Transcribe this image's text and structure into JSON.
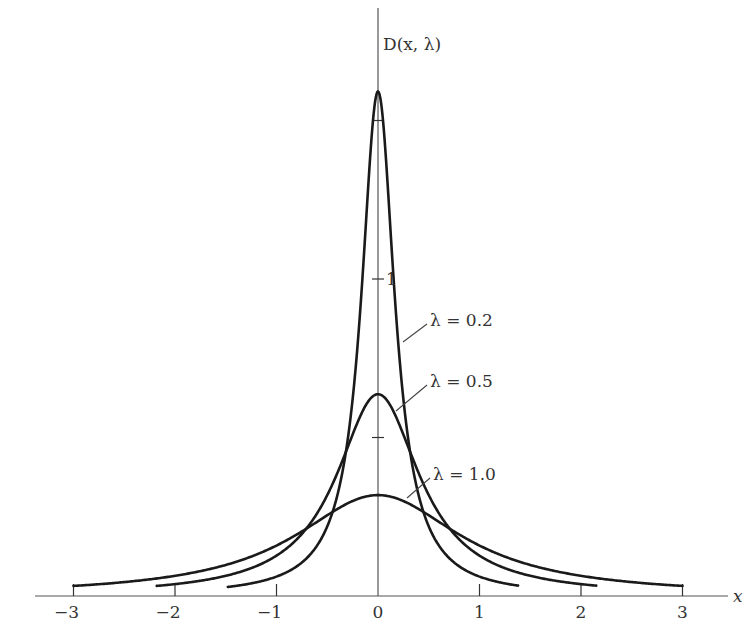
{
  "chart_data": {
    "type": "line",
    "title": "",
    "xlabel": "x",
    "ylabel": "D(x, λ)",
    "xlim": [
      -3.5,
      3.5
    ],
    "ylim": [
      0,
      1.7
    ],
    "grid": false,
    "x_ticks": [
      -3,
      -2,
      -1,
      0,
      1,
      2,
      3
    ],
    "x_tick_labels": [
      "−3",
      "−2",
      "−1",
      "0",
      "1",
      "2",
      "3"
    ],
    "y_ticks": [
      0.5,
      1,
      1.5
    ],
    "y_tick_labels": [
      "",
      "1",
      ""
    ],
    "function": "D(x, λ) = λ / (π (x² + λ²))",
    "series": [
      {
        "name": "λ = 0.2",
        "lambda": 0.2,
        "x_range": [
          -1.48,
          1.38
        ],
        "peak": 1.59,
        "x": [
          -1.48,
          -1,
          -0.6,
          -0.4,
          -0.2,
          -0.1,
          0,
          0.1,
          0.2,
          0.4,
          0.6,
          1,
          1.38
        ],
        "values": [
          0.057,
          0.061,
          0.159,
          0.318,
          0.796,
          1.273,
          1.592,
          1.273,
          0.796,
          0.318,
          0.159,
          0.061,
          0.032
        ]
      },
      {
        "name": "λ = 0.5",
        "lambda": 0.5,
        "x_range": [
          -2.18,
          2.15
        ],
        "peak": 0.64,
        "x": [
          -2.18,
          -2,
          -1.5,
          -1,
          -0.5,
          0,
          0.5,
          1,
          1.5,
          2,
          2.15
        ],
        "values": [
          0.032,
          0.037,
          0.064,
          0.127,
          0.318,
          0.637,
          0.318,
          0.127,
          0.064,
          0.037,
          0.033
        ]
      },
      {
        "name": "λ = 1.0",
        "lambda": 1.0,
        "x_range": [
          -3,
          3
        ],
        "peak": 0.32,
        "x": [
          -3,
          -2,
          -1,
          0,
          1,
          2,
          3
        ],
        "values": [
          0.032,
          0.064,
          0.159,
          0.318,
          0.159,
          0.064,
          0.032
        ]
      }
    ],
    "annotations": [
      {
        "text": "λ = 0.2",
        "points_to_x": 0.25
      },
      {
        "text": "λ = 0.5",
        "points_to_x": 0.2
      },
      {
        "text": "λ = 1.0",
        "points_to_x": 0.3
      }
    ]
  },
  "labels": {
    "y_axis": "D(x, λ)",
    "x_axis": "x",
    "y_tick_1": "1",
    "lambda_02": "λ = 0.2",
    "lambda_05": "λ = 0.5",
    "lambda_10": "λ = 1.0",
    "xt": [
      "−3",
      "−2",
      "−1",
      "0",
      "1",
      "2",
      "3"
    ]
  }
}
